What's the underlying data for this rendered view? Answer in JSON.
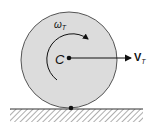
{
  "diagram": {
    "type": "rolling-wheel-kinematics",
    "center_label": "C",
    "angular_velocity_label": "ω",
    "angular_velocity_subscript": "T",
    "velocity_label": "V",
    "velocity_subscript": "T",
    "colors": {
      "wheel_fill": "#dcdcdc",
      "wheel_stroke": "#555555",
      "ink": "#111111",
      "hatch": "#666666"
    }
  }
}
